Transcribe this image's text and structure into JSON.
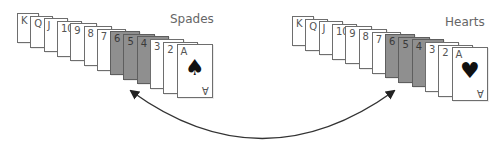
{
  "diagram": {
    "arrow": {
      "type": "bidirectional-curved",
      "color": "#333333",
      "from": "spades-group",
      "to": "hearts-group"
    },
    "groups": [
      {
        "name": "spades",
        "label": "Spades",
        "suit_symbol": "♠",
        "ace_bottom_label": "A",
        "cards": [
          {
            "rank": "K",
            "highlight": false
          },
          {
            "rank": "Q",
            "highlight": false
          },
          {
            "rank": "J",
            "highlight": false
          },
          {
            "rank": "10",
            "highlight": false
          },
          {
            "rank": "9",
            "highlight": false
          },
          {
            "rank": "8",
            "highlight": false
          },
          {
            "rank": "7",
            "highlight": false
          },
          {
            "rank": "6",
            "highlight": true
          },
          {
            "rank": "5",
            "highlight": true
          },
          {
            "rank": "4",
            "highlight": true
          },
          {
            "rank": "3",
            "highlight": false
          },
          {
            "rank": "2",
            "highlight": false
          },
          {
            "rank": "A",
            "highlight": false
          }
        ]
      },
      {
        "name": "hearts",
        "label": "Hearts",
        "suit_symbol": "♥",
        "ace_bottom_label": "A",
        "cards": [
          {
            "rank": "K",
            "highlight": false
          },
          {
            "rank": "Q",
            "highlight": false
          },
          {
            "rank": "J",
            "highlight": false
          },
          {
            "rank": "10",
            "highlight": false
          },
          {
            "rank": "9",
            "highlight": false
          },
          {
            "rank": "8",
            "highlight": false
          },
          {
            "rank": "7",
            "highlight": false
          },
          {
            "rank": "6",
            "highlight": true
          },
          {
            "rank": "5",
            "highlight": true
          },
          {
            "rank": "4",
            "highlight": true
          },
          {
            "rank": "3",
            "highlight": false
          },
          {
            "rank": "2",
            "highlight": false
          },
          {
            "rank": "A",
            "highlight": false
          }
        ]
      }
    ],
    "colors": {
      "highlight_card": "#8f8f8f",
      "card": "#ffffff",
      "border": "#6e6e6e",
      "label": "#666666"
    }
  }
}
